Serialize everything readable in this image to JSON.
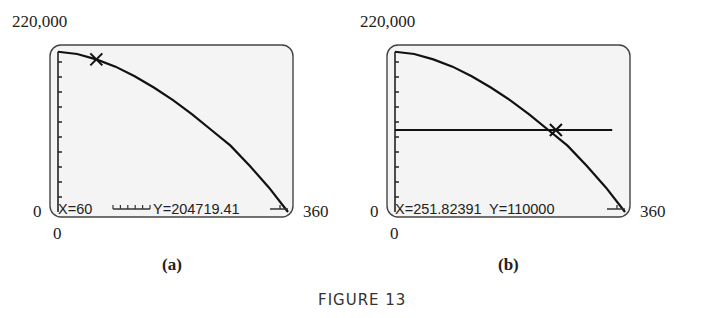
{
  "figure_caption": "FIGURE 13",
  "chart_data": [
    {
      "type": "line",
      "panel_label": "(a)",
      "title": "",
      "xlabel": "",
      "ylabel": "",
      "xlim": [
        0,
        360
      ],
      "ylim": [
        0,
        220000
      ],
      "x_min_label": "0",
      "x_max_label": "360",
      "y_min_label": "0",
      "y_max_label": "220,000",
      "y_ticks_count": 10,
      "x_ticks_count": 5,
      "grid": false,
      "series": [
        {
          "name": "curve",
          "function": "y = 220000*(1 - (x/360)^2)^0.5 approx",
          "x": [
            0,
            30,
            60,
            90,
            120,
            150,
            180,
            210,
            240,
            270,
            300,
            330,
            360
          ],
          "values": [
            215000,
            212000,
            204719.41,
            195000,
            182000,
            167000,
            150000,
            131000,
            110000,
            89000,
            62000,
            33000,
            0
          ]
        }
      ],
      "cursor": {
        "x": 60,
        "y": 204719.41
      },
      "readout": {
        "x_text": "X=60",
        "y_text": "Y=204719.41"
      }
    },
    {
      "type": "line",
      "panel_label": "(b)",
      "title": "",
      "xlabel": "",
      "ylabel": "",
      "xlim": [
        0,
        360
      ],
      "ylim": [
        0,
        220000
      ],
      "x_min_label": "0",
      "x_max_label": "360",
      "y_min_label": "0",
      "y_max_label": "220,000",
      "y_ticks_count": 10,
      "grid": false,
      "series": [
        {
          "name": "curve",
          "x": [
            0,
            30,
            60,
            90,
            120,
            150,
            180,
            210,
            240,
            270,
            300,
            330,
            360
          ],
          "values": [
            215000,
            212000,
            204719.41,
            195000,
            182000,
            167000,
            150000,
            131000,
            110000,
            89000,
            62000,
            33000,
            0
          ]
        },
        {
          "name": "horizontal-line",
          "x": [
            0,
            340
          ],
          "values": [
            110000,
            110000
          ]
        }
      ],
      "cursor": {
        "x": 251.82391,
        "y": 110000
      },
      "readout": {
        "x_text": "X=251.82391",
        "y_text": "Y=110000"
      }
    }
  ]
}
